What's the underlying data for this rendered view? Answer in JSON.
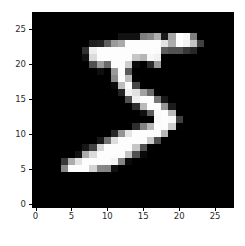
{
  "figure": {
    "kind": "matplotlib-imshow",
    "background_color": "#ffffff",
    "axes_background_color": "#000000",
    "spine_color": "#000000",
    "tick_label_color": "#2b2b2b"
  },
  "chart_data": {
    "type": "heatmap",
    "title": "",
    "subtitle": "",
    "xlabel": "",
    "ylabel": "",
    "colormap": "gray",
    "vmin": 0,
    "vmax": 255,
    "grid": false,
    "legend": "none",
    "colorbar": false,
    "origin": "upper",
    "width": 28,
    "height": 28,
    "xlim": [
      -0.5,
      27.5
    ],
    "ylim": [
      27.5,
      -0.5
    ],
    "xticks": [
      0,
      5,
      10,
      15,
      20,
      25
    ],
    "yticks": [
      0,
      5,
      10,
      15,
      20,
      25
    ],
    "xticklabels": [
      "0",
      "5",
      "10",
      "15",
      "20",
      "25"
    ],
    "yticklabels": [
      "0",
      "5",
      "10",
      "15",
      "20",
      "25"
    ],
    "depicts": "handwritten digit 5 (MNIST)",
    "values": [
      [
        0,
        0,
        0,
        0,
        0,
        0,
        0,
        0,
        0,
        0,
        0,
        0,
        0,
        0,
        0,
        0,
        0,
        0,
        0,
        0,
        0,
        0,
        0,
        0,
        0,
        0,
        0,
        0
      ],
      [
        0,
        0,
        0,
        0,
        0,
        0,
        0,
        0,
        0,
        0,
        0,
        0,
        0,
        0,
        0,
        0,
        0,
        0,
        0,
        0,
        0,
        0,
        0,
        0,
        0,
        0,
        0,
        0
      ],
      [
        0,
        0,
        0,
        0,
        0,
        0,
        0,
        0,
        0,
        0,
        0,
        0,
        0,
        0,
        0,
        0,
        0,
        0,
        0,
        0,
        0,
        0,
        0,
        0,
        0,
        0,
        0,
        0
      ],
      [
        0,
        0,
        0,
        0,
        0,
        0,
        0,
        0,
        0,
        0,
        0,
        0,
        18,
        18,
        18,
        126,
        136,
        175,
        26,
        166,
        255,
        247,
        127,
        0,
        0,
        0,
        0,
        0
      ],
      [
        0,
        0,
        0,
        0,
        0,
        0,
        0,
        0,
        30,
        36,
        94,
        154,
        170,
        253,
        253,
        253,
        253,
        253,
        225,
        172,
        253,
        242,
        195,
        64,
        0,
        0,
        0,
        0
      ],
      [
        0,
        0,
        0,
        0,
        0,
        0,
        0,
        49,
        238,
        253,
        253,
        253,
        253,
        253,
        253,
        253,
        253,
        251,
        93,
        82,
        82,
        56,
        39,
        0,
        0,
        0,
        0,
        0
      ],
      [
        0,
        0,
        0,
        0,
        0,
        0,
        0,
        18,
        219,
        253,
        253,
        253,
        253,
        253,
        198,
        182,
        247,
        241,
        0,
        0,
        0,
        0,
        0,
        0,
        0,
        0,
        0,
        0
      ],
      [
        0,
        0,
        0,
        0,
        0,
        0,
        0,
        0,
        80,
        156,
        107,
        253,
        253,
        205,
        11,
        0,
        43,
        154,
        0,
        0,
        0,
        0,
        0,
        0,
        0,
        0,
        0,
        0
      ],
      [
        0,
        0,
        0,
        0,
        0,
        0,
        0,
        0,
        0,
        14,
        1,
        154,
        253,
        90,
        0,
        0,
        0,
        0,
        0,
        0,
        0,
        0,
        0,
        0,
        0,
        0,
        0,
        0
      ],
      [
        0,
        0,
        0,
        0,
        0,
        0,
        0,
        0,
        0,
        0,
        0,
        139,
        253,
        190,
        2,
        0,
        0,
        0,
        0,
        0,
        0,
        0,
        0,
        0,
        0,
        0,
        0,
        0
      ],
      [
        0,
        0,
        0,
        0,
        0,
        0,
        0,
        0,
        0,
        0,
        0,
        11,
        190,
        253,
        70,
        0,
        0,
        0,
        0,
        0,
        0,
        0,
        0,
        0,
        0,
        0,
        0,
        0
      ],
      [
        0,
        0,
        0,
        0,
        0,
        0,
        0,
        0,
        0,
        0,
        0,
        0,
        35,
        241,
        225,
        160,
        108,
        1,
        0,
        0,
        0,
        0,
        0,
        0,
        0,
        0,
        0,
        0
      ],
      [
        0,
        0,
        0,
        0,
        0,
        0,
        0,
        0,
        0,
        0,
        0,
        0,
        0,
        81,
        240,
        253,
        253,
        119,
        25,
        0,
        0,
        0,
        0,
        0,
        0,
        0,
        0,
        0
      ],
      [
        0,
        0,
        0,
        0,
        0,
        0,
        0,
        0,
        0,
        0,
        0,
        0,
        0,
        0,
        45,
        186,
        253,
        253,
        150,
        27,
        0,
        0,
        0,
        0,
        0,
        0,
        0,
        0
      ],
      [
        0,
        0,
        0,
        0,
        0,
        0,
        0,
        0,
        0,
        0,
        0,
        0,
        0,
        0,
        0,
        16,
        93,
        252,
        253,
        187,
        0,
        0,
        0,
        0,
        0,
        0,
        0,
        0
      ],
      [
        0,
        0,
        0,
        0,
        0,
        0,
        0,
        0,
        0,
        0,
        0,
        0,
        0,
        0,
        0,
        0,
        0,
        249,
        253,
        249,
        64,
        0,
        0,
        0,
        0,
        0,
        0,
        0
      ],
      [
        0,
        0,
        0,
        0,
        0,
        0,
        0,
        0,
        0,
        0,
        0,
        0,
        0,
        0,
        46,
        130,
        183,
        253,
        253,
        207,
        2,
        0,
        0,
        0,
        0,
        0,
        0,
        0
      ],
      [
        0,
        0,
        0,
        0,
        0,
        0,
        0,
        0,
        0,
        0,
        0,
        39,
        148,
        229,
        253,
        253,
        253,
        250,
        182,
        0,
        0,
        0,
        0,
        0,
        0,
        0,
        0,
        0
      ],
      [
        0,
        0,
        0,
        0,
        0,
        0,
        0,
        0,
        0,
        24,
        114,
        221,
        253,
        253,
        253,
        253,
        201,
        78,
        0,
        0,
        0,
        0,
        0,
        0,
        0,
        0,
        0,
        0
      ],
      [
        0,
        0,
        0,
        0,
        0,
        0,
        0,
        23,
        66,
        213,
        253,
        253,
        253,
        253,
        198,
        81,
        2,
        0,
        0,
        0,
        0,
        0,
        0,
        0,
        0,
        0,
        0,
        0
      ],
      [
        0,
        0,
        0,
        0,
        0,
        0,
        18,
        171,
        219,
        253,
        253,
        253,
        253,
        195,
        80,
        9,
        0,
        0,
        0,
        0,
        0,
        0,
        0,
        0,
        0,
        0,
        0,
        0
      ],
      [
        0,
        0,
        0,
        0,
        55,
        172,
        226,
        253,
        253,
        253,
        253,
        244,
        133,
        11,
        0,
        0,
        0,
        0,
        0,
        0,
        0,
        0,
        0,
        0,
        0,
        0,
        0,
        0
      ],
      [
        0,
        0,
        0,
        0,
        136,
        253,
        253,
        253,
        212,
        135,
        132,
        16,
        0,
        0,
        0,
        0,
        0,
        0,
        0,
        0,
        0,
        0,
        0,
        0,
        0,
        0,
        0,
        0
      ],
      [
        0,
        0,
        0,
        0,
        0,
        0,
        0,
        0,
        0,
        0,
        0,
        0,
        0,
        0,
        0,
        0,
        0,
        0,
        0,
        0,
        0,
        0,
        0,
        0,
        0,
        0,
        0,
        0
      ],
      [
        0,
        0,
        0,
        0,
        0,
        0,
        0,
        0,
        0,
        0,
        0,
        0,
        0,
        0,
        0,
        0,
        0,
        0,
        0,
        0,
        0,
        0,
        0,
        0,
        0,
        0,
        0,
        0
      ],
      [
        0,
        0,
        0,
        0,
        0,
        0,
        0,
        0,
        0,
        0,
        0,
        0,
        0,
        0,
        0,
        0,
        0,
        0,
        0,
        0,
        0,
        0,
        0,
        0,
        0,
        0,
        0,
        0
      ],
      [
        0,
        0,
        0,
        0,
        0,
        0,
        0,
        0,
        0,
        0,
        0,
        0,
        0,
        0,
        0,
        0,
        0,
        0,
        0,
        0,
        0,
        0,
        0,
        0,
        0,
        0,
        0,
        0
      ],
      [
        0,
        0,
        0,
        0,
        0,
        0,
        0,
        0,
        0,
        0,
        0,
        0,
        0,
        0,
        0,
        0,
        0,
        0,
        0,
        0,
        0,
        0,
        0,
        0,
        0,
        0,
        0,
        0
      ]
    ]
  }
}
